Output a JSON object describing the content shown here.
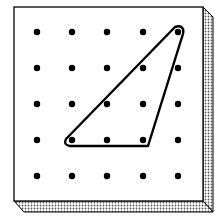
{
  "diagram": {
    "type": "geoboard",
    "grid": {
      "rows": 5,
      "cols": 5
    },
    "pegs_x": [
      37,
      72,
      107,
      143,
      178
    ],
    "pegs_y": [
      32,
      68,
      104,
      140,
      176
    ],
    "rubber_band": {
      "shape": "triangle",
      "vertices": [
        [
          178,
          32
        ],
        [
          72,
          140
        ],
        [
          143,
          140
        ]
      ]
    },
    "colors": {
      "board": "#ffffff",
      "outline": "#000000",
      "peg": "#000000",
      "band": "#000000"
    }
  }
}
